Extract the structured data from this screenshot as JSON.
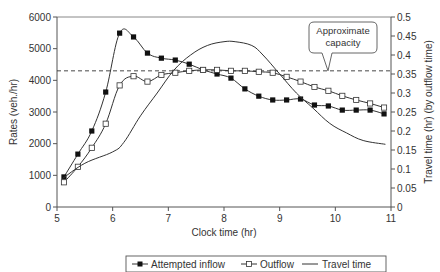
{
  "chart_data": {
    "type": "line",
    "title": "",
    "xlabel": "Clock time (hr)",
    "ylabel": "Rates (veh./hr)",
    "y2label": "Travel time (hr) (by outflow time)",
    "xlim": [
      5,
      11
    ],
    "ylim": [
      0,
      6000
    ],
    "y2lim": [
      0,
      0.5
    ],
    "x_ticks": [
      "5",
      "6",
      "7",
      "8",
      "9",
      "10",
      "11"
    ],
    "y_ticks": [
      "0",
      "1000",
      "2000",
      "3000",
      "4000",
      "5000",
      "6000"
    ],
    "y2_ticks": [
      "0",
      "0.05",
      "0.1",
      "0.15",
      "0.2",
      "0.25",
      "0.3",
      "0.35",
      "0.4",
      "0.45",
      "0.5"
    ],
    "grid": false,
    "legend_position": "bottom",
    "x": [
      5.125,
      5.375,
      5.625,
      5.875,
      6.125,
      6.375,
      6.625,
      6.875,
      7.125,
      7.375,
      7.625,
      7.875,
      8.125,
      8.375,
      8.625,
      8.875,
      9.125,
      9.375,
      9.625,
      9.875,
      10.125,
      10.375,
      10.625,
      10.875
    ],
    "series": [
      {
        "name": "Attempted inflow",
        "axis": "left",
        "marker": "filled-square",
        "values": [
          950,
          1670,
          2400,
          3630,
          5490,
          5370,
          4860,
          4700,
          4640,
          4510,
          4330,
          4200,
          4070,
          3730,
          3500,
          3380,
          3380,
          3410,
          3220,
          3190,
          3060,
          3060,
          3060,
          2940
        ]
      },
      {
        "name": "Outflow",
        "axis": "left",
        "marker": "open-square",
        "values": [
          780,
          1270,
          1870,
          2630,
          3840,
          4130,
          3960,
          4170,
          4240,
          4300,
          4330,
          4330,
          4300,
          4300,
          4270,
          4240,
          4110,
          3960,
          3790,
          3670,
          3510,
          3380,
          3270,
          3140
        ]
      },
      {
        "name": "Travel time",
        "axis": "right",
        "marker": "none",
        "x": [
          5.1,
          5.5,
          6.0,
          6.2,
          6.5,
          6.8,
          7.1,
          7.4,
          7.7,
          8.0,
          8.2,
          8.5,
          8.7,
          9.0,
          9.3,
          9.6,
          9.9,
          10.2,
          10.5,
          10.9
        ],
        "values": [
          0.075,
          0.115,
          0.145,
          0.17,
          0.24,
          0.3,
          0.36,
          0.4,
          0.425,
          0.435,
          0.435,
          0.425,
          0.4,
          0.35,
          0.3,
          0.26,
          0.22,
          0.195,
          0.175,
          0.165
        ]
      }
    ],
    "reference_lines": [
      {
        "name": "Approximate capacity",
        "axis": "left",
        "value": 4300,
        "style": "dashed"
      }
    ],
    "annotations": [
      {
        "text": "Approximate capacity",
        "type": "callout",
        "points_to": "capacity-line"
      }
    ]
  },
  "legend": {
    "items": [
      {
        "label": "Attempted inflow",
        "marker": "filled-square"
      },
      {
        "label": "Outflow",
        "marker": "open-square"
      },
      {
        "label": "Travel time",
        "marker": "line"
      }
    ]
  },
  "callout": {
    "line1": "Approximate",
    "line2": "capacity"
  },
  "colors": {
    "line": "#333333",
    "axis": "#555555",
    "background": "#ffffff"
  }
}
